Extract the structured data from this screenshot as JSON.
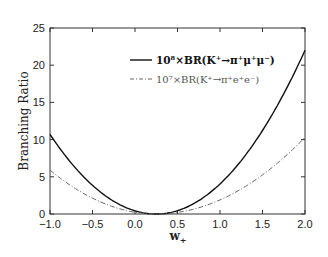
{
  "chart_data": {
    "type": "line",
    "title": "",
    "xlabel": "w+",
    "ylabel": "Branching Ratio",
    "xlim": [
      -1.0,
      2.0
    ],
    "ylim": [
      0,
      25
    ],
    "x_ticks": [
      "-1.0",
      "-0.5",
      "0.0",
      "0.5",
      "1.0",
      "1.5",
      "2.0"
    ],
    "y_ticks": [
      "0",
      "5",
      "10",
      "15",
      "20",
      "25"
    ],
    "legend_position": "upper right",
    "series": [
      {
        "name": "10^8×BR(K+→π+μ+μ−)",
        "style": "solid",
        "x": [
          -1.0,
          -0.5,
          0.0,
          0.25,
          0.5,
          1.0,
          1.5,
          2.0
        ],
        "y": [
          10.7,
          4.6,
          0.9,
          0.0,
          0.3,
          3.7,
          11.0,
          22.0
        ]
      },
      {
        "name": "10^7×BR(K+→π+e+e−)",
        "style": "dashdot",
        "x": [
          -1.0,
          -0.5,
          0.0,
          0.25,
          0.5,
          1.0,
          1.5,
          2.0
        ],
        "y": [
          5.9,
          2.6,
          0.5,
          0.0,
          0.2,
          1.9,
          5.3,
          10.3
        ]
      }
    ]
  },
  "legend": {
    "solid_label": "10⁸×BR(K⁺→π⁺μ⁺μ⁻)",
    "dashdot_label": "10⁷×BR(K⁺→π⁺e⁺e⁻)"
  },
  "axes": {
    "xlabel": "w",
    "xlabel_sub": "+",
    "ylabel": "Branching Ratio"
  }
}
